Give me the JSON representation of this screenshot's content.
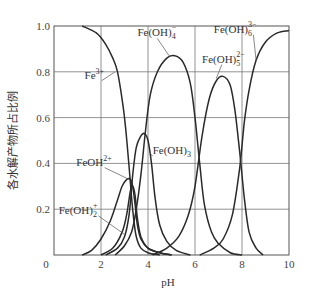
{
  "chart_data": {
    "type": "line",
    "title": "",
    "xlabel": "pH",
    "ylabel": "各水解产物所占比例",
    "xlim": [
      0,
      10
    ],
    "ylim": [
      0,
      1.0
    ],
    "grid": true,
    "legend": "inline labels",
    "x_ticks": [
      "0",
      "2",
      "4",
      "6",
      "8",
      "10"
    ],
    "y_ticks": [
      "0.2",
      "0.4",
      "0.6",
      "0.8",
      "1.0"
    ],
    "series": [
      {
        "name": "Fe3+",
        "label_text": "Fe³⁺",
        "points": [
          [
            1.2,
            1.0
          ],
          [
            1.8,
            0.97
          ],
          [
            2.2,
            0.92
          ],
          [
            2.5,
            0.86
          ],
          [
            2.7,
            0.8
          ],
          [
            2.9,
            0.68
          ],
          [
            3.0,
            0.6
          ],
          [
            3.1,
            0.5
          ],
          [
            3.2,
            0.38
          ],
          [
            3.3,
            0.25
          ],
          [
            3.4,
            0.15
          ],
          [
            3.5,
            0.08
          ],
          [
            3.7,
            0.03
          ],
          [
            4.0,
            0.01
          ],
          [
            4.5,
            0.0
          ]
        ]
      },
      {
        "name": "FeOH2+",
        "label_text": "FeOH²⁺",
        "points": [
          [
            1.2,
            0.0
          ],
          [
            1.6,
            0.02
          ],
          [
            2.0,
            0.07
          ],
          [
            2.4,
            0.15
          ],
          [
            2.7,
            0.24
          ],
          [
            2.9,
            0.3
          ],
          [
            3.1,
            0.33
          ],
          [
            3.25,
            0.33
          ],
          [
            3.35,
            0.3
          ],
          [
            3.45,
            0.22
          ],
          [
            3.55,
            0.13
          ],
          [
            3.7,
            0.07
          ],
          [
            4.0,
            0.03
          ],
          [
            4.5,
            0.01
          ],
          [
            5.0,
            0.0
          ]
        ]
      },
      {
        "name": "Fe(OH)2+",
        "label_text": "Fe(OH)₂⁺",
        "points": [
          [
            2.0,
            0.0
          ],
          [
            2.5,
            0.03
          ],
          [
            2.9,
            0.1
          ],
          [
            3.1,
            0.18
          ],
          [
            3.25,
            0.28
          ],
          [
            3.35,
            0.3
          ],
          [
            3.45,
            0.26
          ],
          [
            3.55,
            0.16
          ],
          [
            3.7,
            0.08
          ],
          [
            4.0,
            0.03
          ],
          [
            4.5,
            0.01
          ],
          [
            5.0,
            0.0
          ]
        ]
      },
      {
        "name": "Fe(OH)3",
        "label_text": "Fe(OH)₃",
        "points": [
          [
            2.2,
            0.0
          ],
          [
            2.7,
            0.03
          ],
          [
            3.0,
            0.08
          ],
          [
            3.2,
            0.18
          ],
          [
            3.35,
            0.35
          ],
          [
            3.5,
            0.47
          ],
          [
            3.7,
            0.52
          ],
          [
            3.85,
            0.53
          ],
          [
            4.0,
            0.5
          ],
          [
            4.15,
            0.4
          ],
          [
            4.3,
            0.25
          ],
          [
            4.5,
            0.13
          ],
          [
            4.8,
            0.06
          ],
          [
            5.2,
            0.02
          ],
          [
            5.8,
            0.0
          ]
        ]
      },
      {
        "name": "Fe(OH)4-",
        "label_text": "Fe(OH)₄⁻",
        "points": [
          [
            2.6,
            0.0
          ],
          [
            3.0,
            0.04
          ],
          [
            3.3,
            0.1
          ],
          [
            3.5,
            0.2
          ],
          [
            3.7,
            0.35
          ],
          [
            3.9,
            0.55
          ],
          [
            4.1,
            0.7
          ],
          [
            4.4,
            0.8
          ],
          [
            4.8,
            0.86
          ],
          [
            5.15,
            0.87
          ],
          [
            5.5,
            0.84
          ],
          [
            5.8,
            0.75
          ],
          [
            6.0,
            0.6
          ],
          [
            6.2,
            0.4
          ],
          [
            6.4,
            0.22
          ],
          [
            6.7,
            0.1
          ],
          [
            7.0,
            0.05
          ],
          [
            7.5,
            0.01
          ],
          [
            8.0,
            0.0
          ]
        ]
      },
      {
        "name": "Fe(OH)5 2-",
        "label_text": "Fe(OH)₅²⁻",
        "points": [
          [
            4.2,
            0.0
          ],
          [
            4.8,
            0.03
          ],
          [
            5.3,
            0.08
          ],
          [
            5.7,
            0.17
          ],
          [
            6.0,
            0.3
          ],
          [
            6.3,
            0.52
          ],
          [
            6.6,
            0.68
          ],
          [
            6.9,
            0.76
          ],
          [
            7.2,
            0.78
          ],
          [
            7.5,
            0.74
          ],
          [
            7.7,
            0.63
          ],
          [
            7.9,
            0.45
          ],
          [
            8.1,
            0.25
          ],
          [
            8.3,
            0.1
          ],
          [
            8.6,
            0.03
          ],
          [
            8.9,
            0.0
          ]
        ]
      },
      {
        "name": "Fe(OH)6 3-",
        "label_text": "Fe(OH)₆³⁻",
        "points": [
          [
            6.2,
            0.0
          ],
          [
            6.8,
            0.03
          ],
          [
            7.2,
            0.07
          ],
          [
            7.6,
            0.18
          ],
          [
            7.9,
            0.38
          ],
          [
            8.1,
            0.58
          ],
          [
            8.3,
            0.72
          ],
          [
            8.6,
            0.85
          ],
          [
            9.0,
            0.93
          ],
          [
            9.5,
            0.97
          ],
          [
            10.0,
            0.98
          ]
        ]
      }
    ],
    "labels": [
      {
        "series": "Fe3+",
        "text_base": "Fe",
        "sup": "3+",
        "sub": "",
        "x": 1.3,
        "y": 0.77,
        "anchor": [
          2.6,
          0.8
        ]
      },
      {
        "series": "FeOH2+",
        "text_base": "FeOH",
        "sup": "2+",
        "sub": "",
        "x": 0.95,
        "y": 0.39,
        "anchor": [
          3.2,
          0.33
        ]
      },
      {
        "series": "Fe(OH)2+",
        "text_base": "Fe(OH)",
        "sup": "+",
        "sub": "2",
        "x": 0.2,
        "y": 0.18,
        "anchor": [
          3.0,
          0.09
        ]
      },
      {
        "series": "Fe(OH)3",
        "text_base": "Fe(OH)",
        "sup": "",
        "sub": "3",
        "x": 4.2,
        "y": 0.44,
        "anchor": [
          4.05,
          0.45
        ]
      },
      {
        "series": "Fe(OH)4-",
        "text_base": "Fe(OH)",
        "sup": "−",
        "sub": "4",
        "x": 3.55,
        "y": 0.955,
        "anchor": [
          4.9,
          0.87
        ]
      },
      {
        "series": "Fe(OH)5 2-",
        "text_base": "Fe(OH)",
        "sup": "2−",
        "sub": "5",
        "x": 6.3,
        "y": 0.84,
        "anchor": [
          6.9,
          0.77
        ]
      },
      {
        "series": "Fe(OH)6 3-",
        "text_base": "Fe(OH)",
        "sup": "3−",
        "sub": "6",
        "x": 6.8,
        "y": 0.97,
        "anchor": [
          8.6,
          0.85
        ]
      }
    ]
  },
  "axes": {
    "xlabel": "pH",
    "ylabel": "各水解产物所占比例",
    "x_ticks": [
      "0",
      "2",
      "4",
      "6",
      "8",
      "10"
    ],
    "y_ticks": [
      "0.2",
      "0.4",
      "0.6",
      "0.8",
      "1.0"
    ]
  }
}
